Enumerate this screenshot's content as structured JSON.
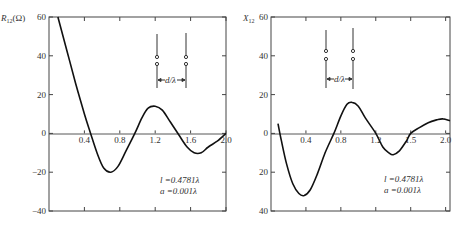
{
  "chart_data": [
    {
      "type": "line",
      "title": "",
      "ylabel": "R12(Ω)",
      "xlabel": "d/λ",
      "xlim": [
        0,
        2.0
      ],
      "ylim": [
        -40,
        60
      ],
      "x_ticks": [
        "0.4",
        "0.8",
        "1.2",
        "1.6",
        "2.0"
      ],
      "y_ticks": [
        "60",
        "40",
        "20",
        "0",
        "−20",
        "−40"
      ],
      "annotations": [
        "l =0.4781λ",
        "a =0.001λ",
        "d/λ"
      ],
      "series": [
        {
          "name": "R12",
          "x": [
            0.1,
            0.2,
            0.3,
            0.4,
            0.47,
            0.55,
            0.62,
            0.7,
            0.78,
            0.87,
            0.97,
            1.05,
            1.12,
            1.2,
            1.28,
            1.37,
            1.47,
            1.56,
            1.64,
            1.72,
            1.8,
            1.9,
            2.0
          ],
          "values": [
            60,
            43,
            26,
            10,
            0,
            -11,
            -18,
            -20,
            -17,
            -9,
            0,
            8,
            13,
            14,
            12,
            6,
            -1,
            -7,
            -10,
            -10,
            -7,
            -4,
            0
          ]
        }
      ]
    },
    {
      "type": "line",
      "title": "",
      "ylabel": "X12",
      "xlabel": "d/λ",
      "xlim": [
        0,
        2.05
      ],
      "ylim": [
        -40,
        60
      ],
      "x_ticks": [
        "0.4",
        "0.8",
        "1.2",
        "1.5",
        "2.0"
      ],
      "y_ticks": [
        "60",
        "40",
        "20",
        "0",
        "20",
        "40"
      ],
      "annotations": [
        "l =0.4781λ",
        "a =0.001λ",
        "d/λ"
      ],
      "series": [
        {
          "name": "X12",
          "x": [
            0.08,
            0.12,
            0.18,
            0.25,
            0.32,
            0.38,
            0.45,
            0.53,
            0.62,
            0.72,
            0.8,
            0.87,
            0.93,
            1.0,
            1.08,
            1.2,
            1.28,
            1.35,
            1.4,
            1.47,
            1.55,
            1.6,
            1.7,
            1.8,
            1.9,
            1.97,
            2.05
          ],
          "values": [
            5,
            -4,
            -16,
            -26,
            -31,
            -32,
            -29,
            -21,
            -10,
            0,
            9,
            15,
            16,
            14,
            8,
            0,
            -7,
            -10,
            -11,
            -9,
            -4,
            0,
            3,
            5.5,
            7,
            7.5,
            6.5
          ]
        }
      ]
    }
  ],
  "left": {
    "ylabel_main": "R",
    "ylabel_sub": "12",
    "ylabel_unit": "(Ω)",
    "y_ticks": [
      {
        "label": "60",
        "v": 60
      },
      {
        "label": "40",
        "v": 40
      },
      {
        "label": "20",
        "v": 20
      },
      {
        "label": "0",
        "v": 0
      },
      {
        "label": "−20",
        "v": -20
      },
      {
        "label": "−40",
        "v": -40
      }
    ],
    "x_ticks": [
      "0.4",
      "0.8",
      "1.2",
      "1.6",
      "2.0"
    ],
    "param_l": "l =0.4781λ",
    "param_a": "a =0.001λ",
    "spacing_label": "d/λ"
  },
  "right": {
    "ylabel_main": "X",
    "ylabel_sub": "12",
    "y_ticks": [
      {
        "label": "60",
        "v": 60
      },
      {
        "label": "40",
        "v": 40
      },
      {
        "label": "20",
        "v": 20
      },
      {
        "label": "0",
        "v": 0
      },
      {
        "label": "20",
        "v": -20
      },
      {
        "label": "40",
        "v": -40
      }
    ],
    "x_ticks": [
      "0.4",
      "0.8",
      "1.2",
      "1.5",
      "2.0"
    ],
    "param_l": "l =0.4781λ",
    "param_a": "a =0.001λ",
    "spacing_label": "d/λ"
  }
}
